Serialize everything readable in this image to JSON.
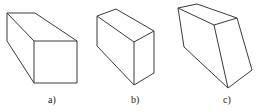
{
  "figures": [
    {
      "id": "a",
      "label": "a)",
      "description": "rectangular prism, oblique view",
      "edges": "M7,13 L35,13 L77,41 L77,83 L34,83 L7,41 Z M7,13 L34,41 L77,41 M34,41 L34,83",
      "label_pos": {
        "x": 48,
        "y": 95
      }
    },
    {
      "id": "b",
      "label": "b)",
      "description": "rectangular block, isometric-like view",
      "edges": "M97,16 L116,9 L154,31 L154,73 L134,85 L97,46 Z M97,16 L134,42 L154,31 M134,42 L134,85",
      "label_pos": {
        "x": 131,
        "y": 95
      }
    },
    {
      "id": "c",
      "label": "c)",
      "description": "distorted prism (skewed faces)",
      "edges": "M178,8 L197,4 L237,18 L252,70 L228,88 L184,47 Z M178,8 L214,25 L237,18 M214,25 L228,88",
      "label_pos": {
        "x": 223,
        "y": 95
      }
    }
  ],
  "colors": {
    "stroke": "#3a3a3a",
    "background": "#ffffff"
  }
}
